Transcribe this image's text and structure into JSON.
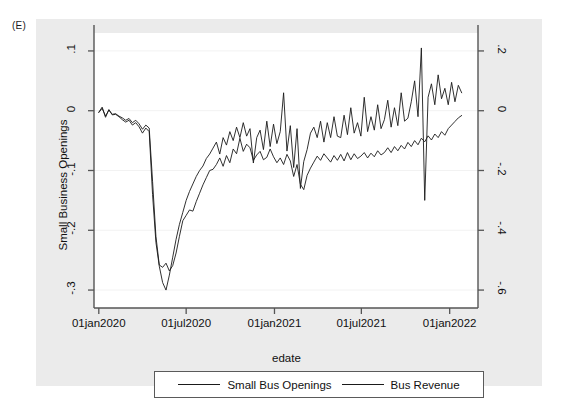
{
  "panel": {
    "letter": "(E)"
  },
  "colors": {
    "figure_background": "#ffffff",
    "graph_region_background": "#ebebeb",
    "plot_background": "#ffffff",
    "axis_line": "#555555",
    "gridline": "#f2f2f2",
    "series_line": "#1a1a1a",
    "legend_border": "#5a5a5a"
  },
  "legend": {
    "position": "below-plot",
    "entries": [
      {
        "label": "Small Bus Openings",
        "swatch": "line"
      },
      {
        "label": "Bus Revenue",
        "swatch": "line"
      }
    ]
  },
  "chart_data": {
    "type": "line",
    "title": "",
    "subtitle": "",
    "xlabel": "edate",
    "ylabel": "Small Business Openings",
    "y2label": "Business Revenue",
    "grid": true,
    "legend_position": "bottom",
    "x_tick_labels": [
      "01jan2020",
      "01jul2020",
      "01jan2021",
      "01jul2021",
      "01jan2022"
    ],
    "x_tick_values": [
      0,
      182,
      366,
      547,
      731
    ],
    "xlim": [
      -10,
      790
    ],
    "y_tick_labels": [
      ".1",
      "0",
      "-.1",
      "-.2",
      "-.3"
    ],
    "y_tick_values": [
      0.1,
      0,
      -0.1,
      -0.2,
      -0.3
    ],
    "ylim": [
      -0.33,
      0.13
    ],
    "y2_tick_labels": [
      ".2",
      "0",
      "-.2",
      "-.4",
      "-.6"
    ],
    "y2_tick_values": [
      0.2,
      0,
      -0.2,
      -0.4,
      -0.6
    ],
    "y2lim": [
      -0.66,
      0.26
    ],
    "series": [
      {
        "name": "Small Bus Openings",
        "axis": "left",
        "x": [
          0,
          7,
          14,
          21,
          28,
          35,
          42,
          49,
          56,
          63,
          70,
          77,
          84,
          91,
          98,
          105,
          112,
          119,
          126,
          133,
          140,
          147,
          154,
          161,
          168,
          175,
          182,
          189,
          196,
          203,
          210,
          217,
          224,
          231,
          238,
          245,
          252,
          259,
          266,
          273,
          280,
          287,
          294,
          301,
          308,
          315,
          322,
          329,
          336,
          343,
          350,
          357,
          364,
          371,
          378,
          385,
          392,
          399,
          406,
          413,
          420,
          427,
          434,
          441,
          448,
          455,
          462,
          469,
          476,
          483,
          490,
          497,
          504,
          511,
          518,
          525,
          532,
          539,
          546,
          553,
          560,
          567,
          574,
          581,
          588,
          595,
          602,
          609,
          616,
          623,
          630,
          637,
          644,
          651,
          658,
          665,
          672,
          679,
          686,
          693,
          700,
          707,
          714,
          721,
          728,
          735,
          742,
          749,
          756
        ],
        "y": [
          -0.003,
          0.004,
          -0.009,
          0.001,
          -0.006,
          -0.005,
          -0.009,
          -0.012,
          -0.016,
          -0.013,
          -0.02,
          -0.016,
          -0.022,
          -0.031,
          -0.024,
          -0.029,
          -0.118,
          -0.21,
          -0.258,
          -0.262,
          -0.255,
          -0.268,
          -0.259,
          -0.238,
          -0.21,
          -0.184,
          -0.175,
          -0.166,
          -0.168,
          -0.152,
          -0.138,
          -0.124,
          -0.112,
          -0.1,
          -0.098,
          -0.09,
          -0.079,
          -0.093,
          -0.075,
          -0.087,
          -0.064,
          -0.072,
          -0.046,
          -0.068,
          -0.056,
          -0.062,
          -0.083,
          -0.074,
          -0.068,
          -0.082,
          -0.078,
          -0.064,
          -0.077,
          -0.087,
          -0.079,
          -0.09,
          -0.073,
          -0.084,
          -0.11,
          -0.09,
          -0.123,
          -0.132,
          -0.108,
          -0.096,
          -0.086,
          -0.076,
          -0.083,
          -0.072,
          -0.079,
          -0.086,
          -0.075,
          -0.083,
          -0.073,
          -0.084,
          -0.07,
          -0.082,
          -0.072,
          -0.08,
          -0.076,
          -0.07,
          -0.079,
          -0.071,
          -0.077,
          -0.067,
          -0.074,
          -0.07,
          -0.062,
          -0.07,
          -0.06,
          -0.067,
          -0.058,
          -0.064,
          -0.053,
          -0.06,
          -0.05,
          -0.057,
          -0.046,
          -0.052,
          -0.042,
          -0.049,
          -0.039,
          -0.045,
          -0.035,
          -0.041,
          -0.03,
          -0.024,
          -0.018,
          -0.012,
          -0.008
        ]
      },
      {
        "name": "Bus Revenue",
        "axis": "right",
        "x": [
          0,
          7,
          14,
          21,
          28,
          35,
          42,
          49,
          56,
          63,
          70,
          77,
          84,
          91,
          98,
          105,
          112,
          119,
          126,
          133,
          140,
          147,
          154,
          161,
          168,
          175,
          182,
          189,
          196,
          203,
          210,
          217,
          224,
          231,
          238,
          245,
          252,
          259,
          266,
          273,
          280,
          287,
          294,
          301,
          308,
          315,
          322,
          329,
          336,
          343,
          350,
          357,
          364,
          371,
          378,
          385,
          392,
          399,
          406,
          413,
          420,
          427,
          434,
          441,
          448,
          455,
          462,
          469,
          476,
          483,
          490,
          497,
          504,
          511,
          518,
          525,
          532,
          539,
          546,
          553,
          560,
          567,
          574,
          581,
          588,
          595,
          602,
          609,
          616,
          623,
          630,
          637,
          644,
          651,
          658,
          665,
          672,
          679,
          686,
          693,
          700,
          707,
          714,
          721,
          728,
          735,
          742,
          749,
          756
        ],
        "y": [
          -0.005,
          0.012,
          -0.022,
          0.004,
          -0.014,
          -0.012,
          -0.02,
          -0.03,
          -0.038,
          -0.032,
          -0.048,
          -0.04,
          -0.054,
          -0.075,
          -0.058,
          -0.07,
          -0.28,
          -0.44,
          -0.52,
          -0.575,
          -0.6,
          -0.55,
          -0.49,
          -0.43,
          -0.38,
          -0.34,
          -0.3,
          -0.27,
          -0.245,
          -0.22,
          -0.2,
          -0.185,
          -0.16,
          -0.145,
          -0.125,
          -0.105,
          -0.145,
          -0.09,
          -0.115,
          -0.07,
          -0.1,
          -0.055,
          -0.09,
          -0.04,
          -0.085,
          -0.06,
          -0.175,
          -0.09,
          -0.065,
          -0.13,
          -0.035,
          -0.12,
          -0.045,
          -0.11,
          -0.07,
          0.06,
          -0.135,
          -0.05,
          -0.19,
          -0.06,
          -0.26,
          -0.17,
          -0.13,
          -0.075,
          -0.055,
          -0.09,
          -0.035,
          -0.105,
          -0.04,
          -0.09,
          -0.02,
          -0.085,
          -0.09,
          -0.015,
          -0.08,
          0.01,
          -0.075,
          -0.04,
          -0.085,
          0.045,
          -0.07,
          -0.02,
          -0.065,
          0.02,
          -0.06,
          -0.03,
          0.035,
          -0.055,
          0.01,
          -0.05,
          0.06,
          -0.035,
          -0.025,
          0.03,
          0.1,
          -0.02,
          0.21,
          -0.3,
          0.045,
          0.09,
          0.02,
          0.12,
          0.04,
          0.075,
          0.02,
          0.095,
          0.03,
          0.085,
          0.06
        ]
      }
    ]
  }
}
